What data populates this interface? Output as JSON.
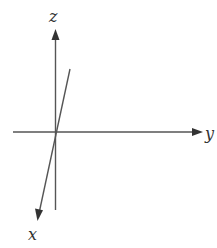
{
  "diagram": {
    "type": "3d-coordinate-axes",
    "colors": {
      "axis": "#555555",
      "arrow": "#333333",
      "label": "#333333",
      "background": "#ffffff"
    },
    "axes": {
      "z": {
        "label": "z",
        "direction": "up"
      },
      "y": {
        "label": "y",
        "direction": "right"
      },
      "x": {
        "label": "x",
        "direction": "down-left (toward viewer)"
      }
    }
  }
}
